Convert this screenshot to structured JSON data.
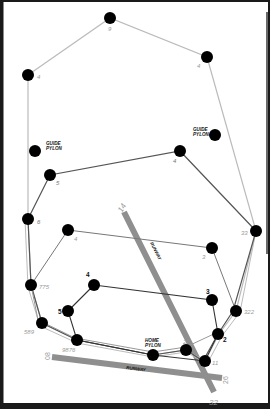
{
  "diagram": {
    "colors": {
      "frame": "#1a1a1a",
      "node": "#000000",
      "path_dark": "#555555",
      "path_light": "#bbbbbb",
      "runway": "#8f8f8f",
      "label_light": "#9a9a9a",
      "label_dark": "#111111"
    },
    "pylons": {
      "guide_left": {
        "label_line1": "GUIDE",
        "label_line2": "PYLON"
      },
      "guide_right": {
        "label_line1": "GUIDE",
        "label_line2": "PYLON"
      },
      "home": {
        "label_line1": "HOME",
        "label_line2": "PYLON"
      }
    },
    "runways": [
      {
        "label": "RUNWAY",
        "end_a": "14",
        "end_b": "32"
      },
      {
        "label": "RUNWAY",
        "end_a": "08",
        "end_b": "26"
      }
    ],
    "nodes": [
      {
        "id": "n-top",
        "label": "9"
      },
      {
        "id": "n-top-right",
        "label": "4"
      },
      {
        "id": "n-upper-left",
        "label": "4"
      },
      {
        "id": "n-mid-right",
        "label": "4"
      },
      {
        "id": "n-left-5",
        "label": "5"
      },
      {
        "id": "n-left-6",
        "label": "6"
      },
      {
        "id": "n-inner-4",
        "label": "4"
      },
      {
        "id": "n-right-33",
        "label": "33"
      },
      {
        "id": "n-right-3",
        "label": "3"
      },
      {
        "id": "n-left-775",
        "label": "775"
      },
      {
        "id": "n-small-4",
        "label": "4"
      },
      {
        "id": "n-small-5",
        "label": "5"
      },
      {
        "id": "n-right-322",
        "label": "322"
      },
      {
        "id": "n-small-3",
        "label": "3"
      },
      {
        "id": "n-left-589",
        "label": "589"
      },
      {
        "id": "n-bottom-9876",
        "label": "9876"
      },
      {
        "id": "n-right-2",
        "label": "2"
      },
      {
        "id": "n-mid-2",
        "label": "2"
      },
      {
        "id": "n-home",
        "label": ""
      },
      {
        "id": "n-bottom-11",
        "label": "11"
      }
    ]
  }
}
